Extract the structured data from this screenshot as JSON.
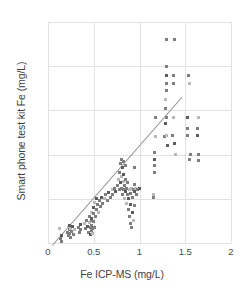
{
  "chart_data": {
    "type": "scatter",
    "title": "",
    "xlabel": "Fe ICP-MS (mg/L)",
    "ylabel": "Smart phone test kit Fe (mg/L)",
    "xlim": [
      0,
      2
    ],
    "ylim": [
      0,
      2.5
    ],
    "xticks": [
      "0",
      "0.5",
      "1",
      "1.5",
      "2"
    ],
    "xtick_values": [
      0,
      0.5,
      1,
      1.5,
      2
    ],
    "yticks": [
      "0",
      "0.5",
      "1",
      "1.5",
      "2",
      "2.5"
    ],
    "ytick_values": [
      0,
      0.5,
      1,
      1.5,
      2,
      2.5
    ],
    "grid": true,
    "legend": "none",
    "trendline": {
      "x0": 0.04,
      "y0": -0.02,
      "x1": 1.46,
      "y1": 1.66
    },
    "series": [
      {
        "name": "Samples",
        "points": [
          [
            0.13,
            0.16
          ],
          [
            0.14,
            0.05
          ],
          [
            0.15,
            0.02
          ],
          [
            0.15,
            0.09
          ],
          [
            0.21,
            0.12
          ],
          [
            0.22,
            0.18
          ],
          [
            0.22,
            0.09
          ],
          [
            0.23,
            0.15
          ],
          [
            0.24,
            0.2
          ],
          [
            0.24,
            0.11
          ],
          [
            0.25,
            0.16
          ],
          [
            0.25,
            0.06
          ],
          [
            0.26,
            0.13
          ],
          [
            0.27,
            0.19
          ],
          [
            0.28,
            0.1
          ],
          [
            0.29,
            0.15
          ],
          [
            0.33,
            0.18
          ],
          [
            0.34,
            0.12
          ],
          [
            0.35,
            0.21
          ],
          [
            0.36,
            0.15
          ],
          [
            0.4,
            0.22
          ],
          [
            0.41,
            0.16
          ],
          [
            0.42,
            0.26
          ],
          [
            0.43,
            0.19
          ],
          [
            0.44,
            0.12
          ],
          [
            0.45,
            0.23
          ],
          [
            0.45,
            0.3
          ],
          [
            0.46,
            0.17
          ],
          [
            0.46,
            0.1
          ],
          [
            0.47,
            0.25
          ],
          [
            0.47,
            0.35
          ],
          [
            0.48,
            0.14
          ],
          [
            0.48,
            0.2
          ],
          [
            0.48,
            0.28
          ],
          [
            0.49,
            0.16
          ],
          [
            0.49,
            0.11
          ],
          [
            0.5,
            0.24
          ],
          [
            0.5,
            0.33
          ],
          [
            0.5,
            0.4
          ],
          [
            0.51,
            0.18
          ],
          [
            0.51,
            0.46
          ],
          [
            0.52,
            0.3
          ],
          [
            0.53,
            0.38
          ],
          [
            0.53,
            0.5
          ],
          [
            0.54,
            0.43
          ],
          [
            0.55,
            0.35
          ],
          [
            0.56,
            0.48
          ],
          [
            0.57,
            0.41
          ],
          [
            0.58,
            0.52
          ],
          [
            0.6,
            0.45
          ],
          [
            0.62,
            0.5
          ],
          [
            0.63,
            0.55
          ],
          [
            0.65,
            0.48
          ],
          [
            0.66,
            0.57
          ],
          [
            0.68,
            0.52
          ],
          [
            0.7,
            0.6
          ],
          [
            0.71,
            0.55
          ],
          [
            0.73,
            0.62
          ],
          [
            0.74,
            0.58
          ],
          [
            0.76,
            0.65
          ],
          [
            0.77,
            0.72
          ],
          [
            0.78,
            0.6
          ],
          [
            0.78,
            0.8
          ],
          [
            0.79,
            0.68
          ],
          [
            0.79,
            0.9
          ],
          [
            0.8,
            0.75
          ],
          [
            0.8,
            0.95
          ],
          [
            0.8,
            0.62
          ],
          [
            0.81,
            0.85
          ],
          [
            0.81,
            0.55
          ],
          [
            0.82,
            0.7
          ],
          [
            0.82,
            0.92
          ],
          [
            0.83,
            0.6
          ],
          [
            0.83,
            0.78
          ],
          [
            0.84,
            0.65
          ],
          [
            0.84,
            0.5
          ],
          [
            0.85,
            0.88
          ],
          [
            0.85,
            0.72
          ],
          [
            0.85,
            0.58
          ],
          [
            0.86,
            0.62
          ],
          [
            0.86,
            0.45
          ],
          [
            0.87,
            0.55
          ],
          [
            0.87,
            0.68
          ],
          [
            0.88,
            0.5
          ],
          [
            0.88,
            0.38
          ],
          [
            0.89,
            0.6
          ],
          [
            0.89,
            0.3
          ],
          [
            0.9,
            0.56
          ],
          [
            0.9,
            0.44
          ],
          [
            0.9,
            0.22
          ],
          [
            0.91,
            0.62
          ],
          [
            0.91,
            0.18
          ],
          [
            0.92,
            0.52
          ],
          [
            0.92,
            0.35
          ],
          [
            0.93,
            0.6
          ],
          [
            0.93,
            0.25
          ],
          [
            0.94,
            0.66
          ],
          [
            0.94,
            0.42
          ],
          [
            0.95,
            0.58
          ],
          [
            0.95,
            0.85
          ],
          [
            0.96,
            0.62
          ],
          [
            0.97,
            0.55
          ],
          [
            0.98,
            0.6
          ],
          [
            1.0,
            0.62
          ],
          [
            1.15,
            0.52
          ],
          [
            1.15,
            0.55
          ],
          [
            1.16,
            0.8
          ],
          [
            1.16,
            0.88
          ],
          [
            1.16,
            0.95
          ],
          [
            1.16,
            1.02
          ],
          [
            1.17,
            1.2
          ],
          [
            1.17,
            1.42
          ],
          [
            1.27,
            1.2
          ],
          [
            1.28,
            1.35
          ],
          [
            1.28,
            1.52
          ],
          [
            1.28,
            1.62
          ],
          [
            1.29,
            1.72
          ],
          [
            1.29,
            1.8
          ],
          [
            1.29,
            1.9
          ],
          [
            1.29,
            2.0
          ],
          [
            1.3,
            1.22
          ],
          [
            1.3,
            1.42
          ],
          [
            1.3,
            2.3
          ],
          [
            1.31,
            1.1
          ],
          [
            1.36,
            1.22
          ],
          [
            1.37,
            1.42
          ],
          [
            1.37,
            1.8
          ],
          [
            1.37,
            1.9
          ],
          [
            1.38,
            1.12
          ],
          [
            1.38,
            2.3
          ],
          [
            1.39,
            1.0
          ],
          [
            1.53,
            1.22
          ],
          [
            1.53,
            1.3
          ],
          [
            1.53,
            1.42
          ],
          [
            1.54,
            1.9
          ],
          [
            1.55,
            1.8
          ],
          [
            1.55,
            0.95
          ],
          [
            1.56,
            1.0
          ],
          [
            1.63,
            1.22
          ],
          [
            1.63,
            1.3
          ],
          [
            1.64,
            1.42
          ],
          [
            1.64,
            1.0
          ],
          [
            1.65,
            0.93
          ]
        ]
      }
    ]
  }
}
